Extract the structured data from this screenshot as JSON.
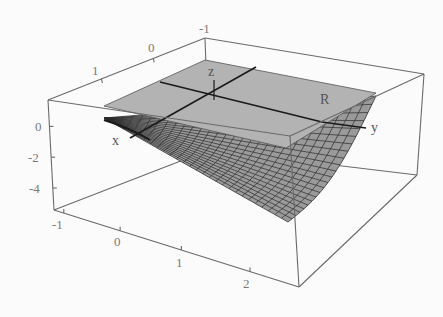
{
  "chart_data": {
    "type": "surface3d",
    "title": "",
    "axes": {
      "x": {
        "ticks": [
          "-1",
          "0",
          "1",
          "2"
        ],
        "range": [
          -1,
          2.5
        ]
      },
      "y": {
        "ticks": [
          "1",
          "0",
          "-1"
        ],
        "range": [
          -1,
          1.3
        ]
      },
      "z": {
        "ticks": [
          "0",
          "-2",
          "-4"
        ],
        "range": [
          -5,
          1
        ]
      }
    },
    "labels": {
      "x_axis": "x",
      "y_axis": "y",
      "z_axis": "z",
      "plane": "R"
    },
    "plane": {
      "z": 0,
      "color": "#b3b3b3"
    },
    "surface": {
      "color": "#9a9a9a",
      "mesh_color": "#2a2a2a",
      "min_z": -5
    },
    "box": true,
    "grid": false
  }
}
